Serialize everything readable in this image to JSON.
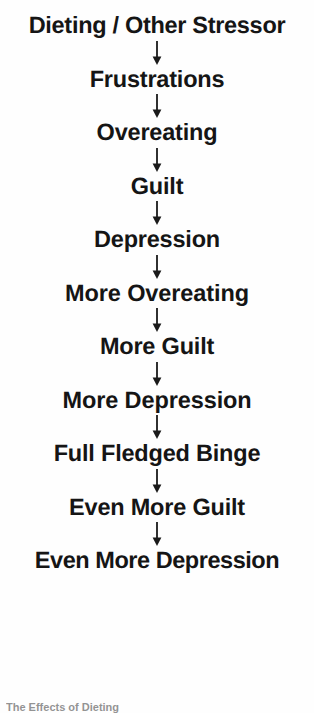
{
  "diagram": {
    "background_color": "#fefefe",
    "text_color": "#151515",
    "arrow_color": "#1a1a1a",
    "arrow_glyph_name": "arrow-down-icon",
    "nodes": [
      {
        "label": "Dieting / Other Stressor"
      },
      {
        "label": "Frustrations"
      },
      {
        "label": "Overeating"
      },
      {
        "label": "Guilt"
      },
      {
        "label": "Depression"
      },
      {
        "label": "More Overeating"
      },
      {
        "label": "More Guilt"
      },
      {
        "label": "More Depression"
      },
      {
        "label": "Full Fledged Binge"
      },
      {
        "label": "Even More Guilt"
      },
      {
        "label": "Even More Depression"
      }
    ]
  },
  "caption": {
    "text": "The Effects of Dieting"
  }
}
